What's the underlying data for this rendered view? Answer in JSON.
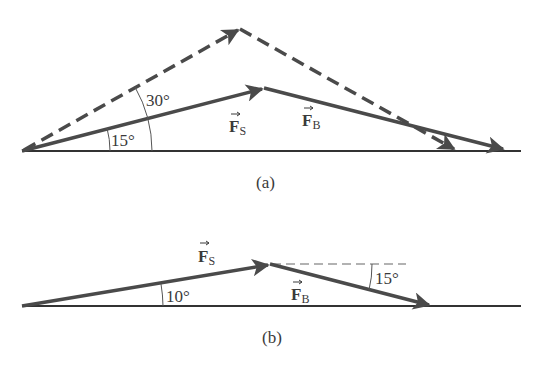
{
  "figure_a": {
    "caption": "(a)",
    "vector_s": {
      "symbol": "F",
      "subscript": "S"
    },
    "vector_b": {
      "symbol": "F",
      "subscript": "B"
    },
    "angle_inner": "15°",
    "angle_outer": "30°"
  },
  "figure_b": {
    "caption": "(b)",
    "vector_s": {
      "symbol": "F",
      "subscript": "S"
    },
    "vector_b": {
      "symbol": "F",
      "subscript": "B"
    },
    "angle_s": "10°",
    "angle_b": "15°"
  },
  "colors": {
    "vector": "#4a4a4a",
    "baseline": "#333333",
    "arc": "#555555"
  }
}
